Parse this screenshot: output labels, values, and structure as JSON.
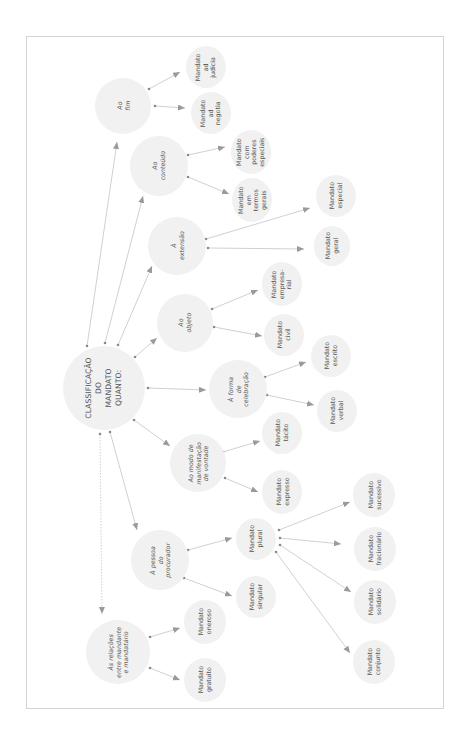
{
  "diagram": {
    "title": "CLASSIFICAÇÃO\nDO\nMANDATO\nQUANTO:",
    "colors": {
      "node_fill": "#f1f1f1",
      "edge": "#bdbdbd",
      "arrow": "#9a9a9a",
      "text": "#555555",
      "frame": "#d4d4d4"
    },
    "categories": [
      {
        "id": "fim",
        "label": "Ao\nfim",
        "children": [
          "Mandato\nad\njudicia",
          "Mandato\nad\nnegotia"
        ]
      },
      {
        "id": "conteudo",
        "label": "Ao\nconteúdo",
        "children": [
          "Mandato\ncom\npoderes\nespeciais",
          "Mandato\nem\ntermos\ngerais"
        ]
      },
      {
        "id": "extensao",
        "label": "À\nextensão",
        "children": [
          "Mandato\nespecial",
          "Mandato\ngeral"
        ]
      },
      {
        "id": "objeto",
        "label": "Ao\nobjeto",
        "children": [
          "Mandato\nempresa-\nrial",
          "Mandato\ncivil"
        ]
      },
      {
        "id": "forma",
        "label": "À forma\nde\ncelebração",
        "children": [
          "Mandato\nescrito",
          "Mandato\nverbal"
        ]
      },
      {
        "id": "modo",
        "label": "Ao modo de\nmanifestação\nde vontade",
        "children": [
          "Mandato\ntácito",
          "Mandato\nexpresso"
        ]
      },
      {
        "id": "pessoa",
        "label": "À pessoa\ndo\nprocurador",
        "children": [
          "Mandato\nplural",
          "Mandato\nsingular"
        ]
      },
      {
        "id": "relacoes",
        "label": "Às relações\nentre mandante\ne mandatário",
        "children": [
          "Mandato\noneroso",
          "Mandato\ngratuito"
        ]
      }
    ],
    "plural_children": [
      "Mandato\nsucessivo",
      "Mandato\nfracionário",
      "Mandato\nsolidário",
      "Mandato\nconjunto"
    ]
  }
}
